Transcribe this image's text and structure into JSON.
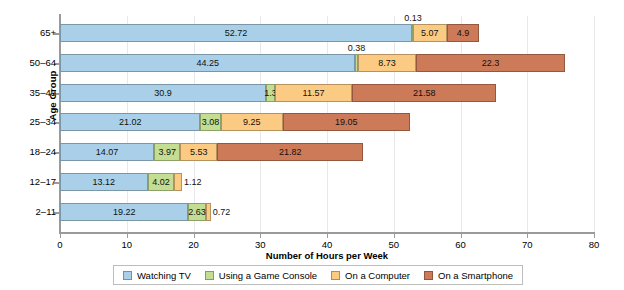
{
  "chart_data": {
    "type": "bar",
    "orientation": "horizontal",
    "stacked": true,
    "title": "",
    "xlabel": "Number of Hours per Week",
    "ylabel": "Age Group",
    "xlim": [
      0,
      80
    ],
    "xticks": [
      0,
      10,
      20,
      30,
      40,
      50,
      60,
      70,
      80
    ],
    "grid": true,
    "legend_position": "bottom",
    "categories": [
      "2–11",
      "12–17",
      "18–24",
      "25–34",
      "35–49",
      "50–64",
      "65+"
    ],
    "categories_top_to_bottom": [
      "65+",
      "50–64",
      "35–49",
      "25–34",
      "18–24",
      "12–17",
      "2–11"
    ],
    "series": [
      {
        "name": "Watching TV",
        "color": "#a9d0e8",
        "values_top_to_bottom": [
          52.72,
          44.25,
          30.9,
          21.02,
          14.07,
          13.12,
          19.22
        ]
      },
      {
        "name": "Using a Game Console",
        "color": "#c3de93",
        "values_top_to_bottom": [
          0.13,
          0.38,
          1.3,
          3.08,
          3.97,
          4.02,
          2.63
        ]
      },
      {
        "name": "On a Computer",
        "color": "#fbcb84",
        "values_top_to_bottom": [
          5.07,
          8.73,
          11.57,
          9.25,
          5.53,
          1.12,
          0.72
        ]
      },
      {
        "name": "On a Smartphone",
        "color": "#cd7a58",
        "values_top_to_bottom": [
          4.9,
          22.3,
          21.58,
          19.05,
          21.82,
          0,
          0
        ]
      }
    ],
    "rows": [
      {
        "category": "65+",
        "segments": [
          {
            "series": "Watching TV",
            "value": 52.72,
            "label": "52.72",
            "label_pos": "inside"
          },
          {
            "series": "Using a Game Console",
            "value": 0.13,
            "label": "0.13",
            "label_pos": "above"
          },
          {
            "series": "On a Computer",
            "value": 5.07,
            "label": "5.07",
            "label_pos": "inside"
          },
          {
            "series": "On a Smartphone",
            "value": 4.9,
            "label": "4.9",
            "label_pos": "inside"
          }
        ]
      },
      {
        "category": "50–64",
        "segments": [
          {
            "series": "Watching TV",
            "value": 44.25,
            "label": "44.25",
            "label_pos": "inside"
          },
          {
            "series": "Using a Game Console",
            "value": 0.38,
            "label": "0.38",
            "label_pos": "above"
          },
          {
            "series": "On a Computer",
            "value": 8.73,
            "label": "8.73",
            "label_pos": "inside"
          },
          {
            "series": "On a Smartphone",
            "value": 22.3,
            "label": "22.3",
            "label_pos": "inside"
          }
        ]
      },
      {
        "category": "35–49",
        "segments": [
          {
            "series": "Watching TV",
            "value": 30.9,
            "label": "30.9",
            "label_pos": "inside"
          },
          {
            "series": "Using a Game Console",
            "value": 1.3,
            "label": "1.3",
            "label_pos": "left-inside"
          },
          {
            "series": "On a Computer",
            "value": 11.57,
            "label": "11.57",
            "label_pos": "inside"
          },
          {
            "series": "On a Smartphone",
            "value": 21.58,
            "label": "21.58",
            "label_pos": "inside"
          }
        ]
      },
      {
        "category": "25–34",
        "segments": [
          {
            "series": "Watching TV",
            "value": 21.02,
            "label": "21.02",
            "label_pos": "inside"
          },
          {
            "series": "Using a Game Console",
            "value": 3.08,
            "label": "3.08",
            "label_pos": "inside"
          },
          {
            "series": "On a Computer",
            "value": 9.25,
            "label": "9.25",
            "label_pos": "inside"
          },
          {
            "series": "On a Smartphone",
            "value": 19.05,
            "label": "19.05",
            "label_pos": "inside"
          }
        ]
      },
      {
        "category": "18–24",
        "segments": [
          {
            "series": "Watching TV",
            "value": 14.07,
            "label": "14.07",
            "label_pos": "inside"
          },
          {
            "series": "Using a Game Console",
            "value": 3.97,
            "label": "3.97",
            "label_pos": "inside"
          },
          {
            "series": "On a Computer",
            "value": 5.53,
            "label": "5.53",
            "label_pos": "inside"
          },
          {
            "series": "On a Smartphone",
            "value": 21.82,
            "label": "21.82",
            "label_pos": "inside"
          }
        ]
      },
      {
        "category": "12–17",
        "segments": [
          {
            "series": "Watching TV",
            "value": 13.12,
            "label": "13.12",
            "label_pos": "inside"
          },
          {
            "series": "Using a Game Console",
            "value": 4.02,
            "label": "4.02",
            "label_pos": "inside"
          },
          {
            "series": "On a Computer",
            "value": 1.12,
            "label": "1.12",
            "label_pos": "right"
          },
          {
            "series": "On a Smartphone",
            "value": 0,
            "label": "",
            "label_pos": "none"
          }
        ]
      },
      {
        "category": "2–11",
        "segments": [
          {
            "series": "Watching TV",
            "value": 19.22,
            "label": "19.22",
            "label_pos": "inside"
          },
          {
            "series": "Using a Game Console",
            "value": 2.63,
            "label": "2.63",
            "label_pos": "inside"
          },
          {
            "series": "On a Computer",
            "value": 0.72,
            "label": "0.72",
            "label_pos": "right"
          },
          {
            "series": "On a Smartphone",
            "value": 0,
            "label": "",
            "label_pos": "none"
          }
        ]
      }
    ]
  },
  "axes": {
    "x_title": "Number of Hours per Week",
    "y_title": "Age Group",
    "x_tick_labels": [
      "0",
      "10",
      "20",
      "30",
      "40",
      "50",
      "60",
      "70",
      "80"
    ],
    "y_tick_labels": [
      "65+",
      "50–64",
      "35–49",
      "25–34",
      "18–24",
      "12–17",
      "2–11"
    ]
  },
  "legend": {
    "items": [
      {
        "label": "Watching TV",
        "color": "#a9d0e8"
      },
      {
        "label": "Using a Game Console",
        "color": "#c3de93"
      },
      {
        "label": "On a Computer",
        "color": "#fbcb84"
      },
      {
        "label": "On a Smartphone",
        "color": "#cd7a58"
      }
    ]
  },
  "colors": {
    "watching_tv": "#a9d0e8",
    "game_console": "#c3de93",
    "computer": "#fbcb84",
    "smartphone": "#cd7a58",
    "axis": "#9a9a9a",
    "grid": "#e8e8e8",
    "background": "#ffffff"
  }
}
